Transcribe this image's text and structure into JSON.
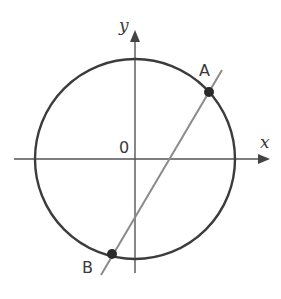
{
  "diagram": {
    "type": "coordinate-geometry",
    "colors": {
      "background": "#ffffff",
      "axis": "#555555",
      "circle": "#3c3c3c",
      "line": "#8a8a8a",
      "point": "#2a2a2a",
      "text": "#3a3a3a"
    },
    "axes": {
      "x_label": "x",
      "y_label": "y",
      "origin_label": "0"
    },
    "circle": {
      "center": "origin",
      "center_px": [
        135,
        159
      ],
      "radius_px": 100
    },
    "line": {
      "from_px": [
        222,
        70
      ],
      "to_px": [
        101,
        275
      ]
    },
    "points": [
      {
        "label": "A",
        "px": [
          209,
          92
        ],
        "label_px": [
          207,
          76
        ]
      },
      {
        "label": "B",
        "px": [
          112,
          254
        ],
        "label_px": [
          88,
          274
        ]
      }
    ]
  }
}
